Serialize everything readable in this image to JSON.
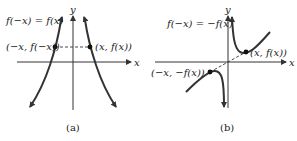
{
  "panels": [
    {
      "id": "a",
      "caption": "(a)",
      "equation": "f(−x) = f(x)",
      "axis_x_label": "x",
      "axis_y_label": "y",
      "point_left_label": "(−x, f(−x))",
      "point_right_label": "(x, f(x))",
      "symmetry": "even"
    },
    {
      "id": "b",
      "caption": "(b)",
      "equation": "f(−x) = −f(x)",
      "axis_x_label": "x",
      "axis_y_label": "y",
      "point_left_label": "(−x, −f(x))",
      "point_right_label": "(x, f(x))",
      "symmetry": "odd"
    }
  ],
  "colors": {
    "ink": "#333333",
    "background": "#ffffff"
  }
}
